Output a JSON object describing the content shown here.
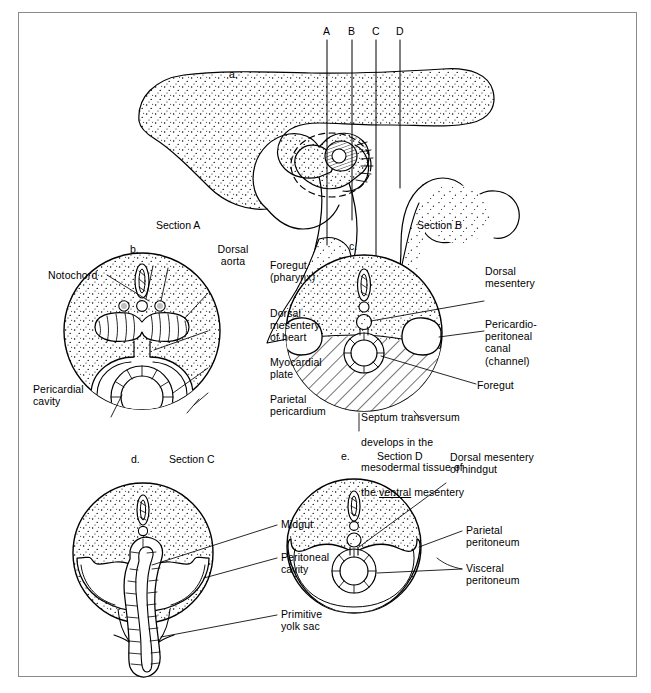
{
  "figure": {
    "type": "anatomical-line-diagram",
    "section_markers": [
      "A",
      "B",
      "C",
      "D"
    ]
  },
  "panels": {
    "a": {
      "letter": "a.",
      "section_label": "",
      "labels": []
    },
    "b": {
      "letter": "b.",
      "section_label": "Section A",
      "labels": [
        {
          "name": "notochord",
          "text": "Notochord"
        },
        {
          "name": "dorsal-aorta",
          "text": "Dorsal\naorta"
        },
        {
          "name": "foregut-pharynx",
          "text": "Foregut\n(pharynx)"
        },
        {
          "name": "dorsal-mesentery-of-heart",
          "text": "Dorsal\nmesentery\nof heart"
        },
        {
          "name": "myocardial-plate",
          "text": "Myocardial\nplate"
        },
        {
          "name": "parietal-pericardium",
          "text": "Parietal\npericardium"
        },
        {
          "name": "pericardial-cavity",
          "text": "Pericardial\ncavity"
        }
      ]
    },
    "c": {
      "letter": "c.",
      "section_label": "Section B",
      "labels": [
        {
          "name": "dorsal-mesentery",
          "text": "Dorsal\nmesentery"
        },
        {
          "name": "pericardio-peritoneal-canal",
          "text": "Pericardio-\nperitoneal\ncanal\n(channel)"
        },
        {
          "name": "foregut",
          "text": "Foregut"
        }
      ],
      "caption": {
        "line1": "Septum transversum",
        "line2": "develops in the",
        "line3": "mesodermal tissue of",
        "line4_pre": "the ",
        "line4_underlined": "ventral",
        "line4_post": " mesentery"
      }
    },
    "d": {
      "letter": "d.",
      "section_label": "Section C",
      "labels": [
        {
          "name": "midgut",
          "text": "Midgut"
        },
        {
          "name": "peritoneal-cavity",
          "text": "Peritoneal\ncavity"
        },
        {
          "name": "primitive-yolk-sac",
          "text": "Primitive\nyolk sac"
        }
      ]
    },
    "e": {
      "letter": "e.",
      "section_label": "Section D",
      "labels": [
        {
          "name": "dorsal-mesentery-of-hindgut",
          "text": "Dorsal mesentery\nof hindgut"
        },
        {
          "name": "parietal-peritoneum",
          "text": "Parietal\nperitoneum"
        },
        {
          "name": "visceral-peritoneum",
          "text": "Visceral\nperitoneum"
        }
      ]
    }
  },
  "colors": {
    "ink": "#000000",
    "frame": "#8a8a8a",
    "page": "#ffffff"
  }
}
